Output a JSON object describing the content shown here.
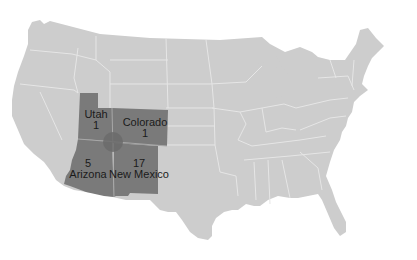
{
  "map": {
    "title": "",
    "region": "United States",
    "colors": {
      "background": "#ffffff",
      "land": "#cdcdcd",
      "border": "#e6e6e6",
      "highlight": "#7a7a7a",
      "four_corners_marker": "#6b6b6b",
      "label_text": "#1a1a1a"
    },
    "highlighted_states": [
      {
        "name": "Utah",
        "value": "1"
      },
      {
        "name": "Colorado",
        "value": "1"
      },
      {
        "name": "Arizona",
        "value": "5"
      },
      {
        "name": "New Mexico",
        "value": "17"
      }
    ]
  }
}
